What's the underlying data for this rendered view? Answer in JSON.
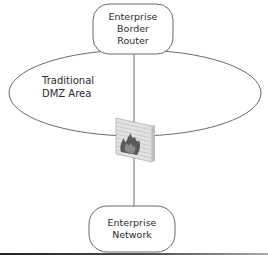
{
  "diagram": {
    "nodes": [
      {
        "id": "border-router",
        "label_lines": [
          "Enterprise",
          "Border",
          "Router"
        ],
        "shape": "rounded-rect"
      },
      {
        "id": "enterprise-network",
        "label_lines": [
          "Enterprise",
          "Network"
        ],
        "shape": "rounded-rect"
      },
      {
        "id": "firewall",
        "label_lines": [],
        "shape": "brick-wall-with-flame",
        "icon": "firewall-icon"
      }
    ],
    "regions": [
      {
        "id": "dmz",
        "label_lines": [
          "Traditional",
          "DMZ Area"
        ],
        "shape": "ellipse"
      }
    ],
    "edges": [
      {
        "from": "border-router",
        "to": "firewall"
      },
      {
        "from": "firewall",
        "to": "enterprise-network"
      }
    ],
    "colors": {
      "stroke": "#6a6a6a",
      "text": "#2a2a2a",
      "wall": "#cfcfcf",
      "flame": "#555555"
    }
  }
}
